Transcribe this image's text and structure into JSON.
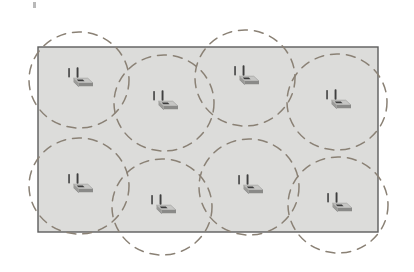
{
  "figure": {
    "description": "Rectangular deployment area containing eight wireless access points, each drawn with a dashed circular coverage area that overlaps its neighbours.",
    "background_color": "#ffffff"
  },
  "deployment_area": {
    "name": "deployment-area",
    "label": "Deployment area",
    "x": 38,
    "y": 47,
    "width": 340,
    "height": 185,
    "fill_color": "#dcdcda",
    "border_color": "#5d5d5d",
    "border_width": 1.4
  },
  "coverage": {
    "stroke_color": "#8a8175",
    "stroke_width": 1.5,
    "dash_pattern": "9 7",
    "fill": "none",
    "radius_x": 50,
    "radius_y": 48,
    "count": 8
  },
  "access_points": [
    {
      "id": "ap-1",
      "label": "Access point 1",
      "row": "top",
      "column": 1,
      "cx": 79,
      "cy": 80,
      "icon": "wireless-access-point-icon"
    },
    {
      "id": "ap-2",
      "label": "Access point 2",
      "row": "top",
      "column": 2,
      "cx": 164,
      "cy": 103,
      "icon": "wireless-access-point-icon"
    },
    {
      "id": "ap-3",
      "label": "Access point 3",
      "row": "top",
      "column": 3,
      "cx": 245,
      "cy": 78,
      "icon": "wireless-access-point-icon"
    },
    {
      "id": "ap-4",
      "label": "Access point 4",
      "row": "top",
      "column": 4,
      "cx": 337,
      "cy": 102,
      "icon": "wireless-access-point-icon"
    },
    {
      "id": "ap-5",
      "label": "Access point 5",
      "row": "bottom",
      "column": 1,
      "cx": 79,
      "cy": 186,
      "icon": "wireless-access-point-icon"
    },
    {
      "id": "ap-6",
      "label": "Access point 6",
      "row": "bottom",
      "column": 2,
      "cx": 162,
      "cy": 207,
      "icon": "wireless-access-point-icon"
    },
    {
      "id": "ap-7",
      "label": "Access point 7",
      "row": "bottom",
      "column": 3,
      "cx": 249,
      "cy": 187,
      "icon": "wireless-access-point-icon"
    },
    {
      "id": "ap-8",
      "label": "Access point 8",
      "row": "bottom",
      "column": 4,
      "cx": 338,
      "cy": 205,
      "icon": "wireless-access-point-icon"
    }
  ],
  "coverage_circles": [
    {
      "id": "coverage-1",
      "of": "ap-1",
      "cx": 79,
      "cy": 80,
      "rx": 50,
      "ry": 48
    },
    {
      "id": "coverage-2",
      "of": "ap-2",
      "cx": 164,
      "cy": 103,
      "rx": 50,
      "ry": 48
    },
    {
      "id": "coverage-3",
      "of": "ap-3",
      "cx": 245,
      "cy": 78,
      "rx": 50,
      "ry": 48
    },
    {
      "id": "coverage-4",
      "of": "ap-4",
      "cx": 337,
      "cy": 102,
      "rx": 50,
      "ry": 48
    },
    {
      "id": "coverage-5",
      "of": "ap-5",
      "cx": 79,
      "cy": 186,
      "rx": 50,
      "ry": 48
    },
    {
      "id": "coverage-6",
      "of": "ap-6",
      "cx": 162,
      "cy": 207,
      "rx": 50,
      "ry": 48
    },
    {
      "id": "coverage-7",
      "of": "ap-7",
      "cx": 249,
      "cy": 187,
      "rx": 50,
      "ry": 48
    },
    {
      "id": "coverage-8",
      "of": "ap-8",
      "cx": 338,
      "cy": 205,
      "rx": 50,
      "ry": 48
    }
  ],
  "device_icon": {
    "name": "wireless-access-point-icon",
    "body_top_color": "#c9c9c7",
    "body_face_color": "#8f8f8d",
    "body_side_color": "#6f6f6d",
    "antenna_color": "#4a4a4a",
    "accent_color": "#3d3d3d",
    "width": 30,
    "height": 26
  },
  "scan_artifacts": [
    {
      "name": "scan-speck-top-left",
      "x": 33,
      "y": 2,
      "width": 3,
      "height": 6
    }
  ]
}
